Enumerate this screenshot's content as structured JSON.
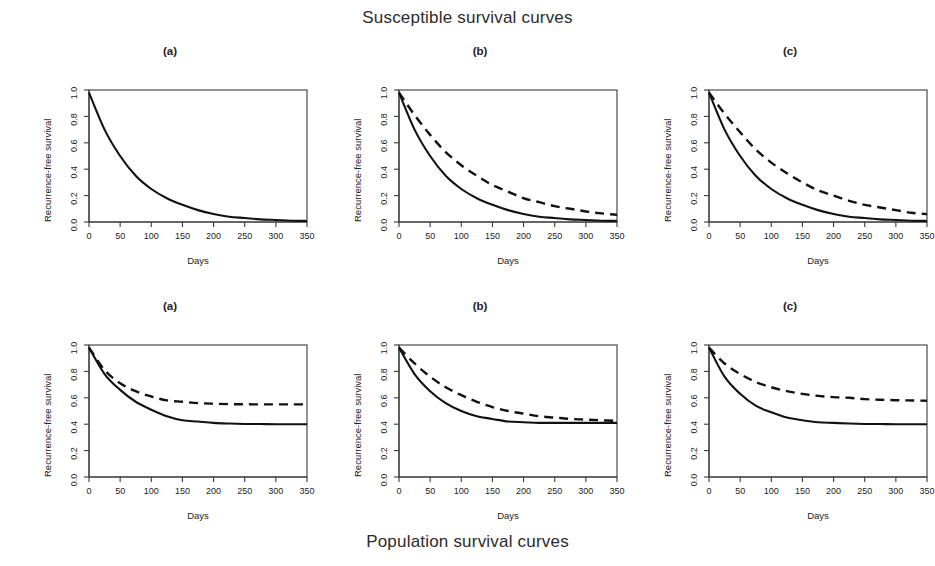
{
  "figure": {
    "top_title": "Susceptible survival curves",
    "bottom_title": "Population survival curves"
  },
  "axes": {
    "xlabel": "Days",
    "ylabel": "Recurrence-free survival",
    "xticks": [
      "0",
      "50",
      "100",
      "150",
      "200",
      "250",
      "300",
      "350"
    ],
    "yticks": [
      "0.0",
      "0.2",
      "0.4",
      "0.6",
      "0.8",
      "1.0"
    ]
  },
  "panel_labels": {
    "a": "(a)",
    "b": "(b)",
    "c": "(c)"
  },
  "colors": {
    "curve": "#111111",
    "frame": "#3a3a3a",
    "background": "#ffffff"
  },
  "chart_data": [
    {
      "type": "line",
      "title": "(a)",
      "group": "Susceptible survival curves",
      "xlabel": "Days",
      "ylabel": "Recurrence-free survival",
      "xlim": [
        0,
        350
      ],
      "ylim": [
        0.0,
        1.0
      ],
      "grid": false,
      "legend": "none",
      "x": [
        0,
        25,
        50,
        75,
        100,
        125,
        150,
        175,
        200,
        225,
        250,
        275,
        300,
        325,
        350
      ],
      "series": [
        {
          "name": "group-1",
          "style": "solid",
          "values": [
            0.98,
            0.7,
            0.5,
            0.35,
            0.25,
            0.18,
            0.13,
            0.09,
            0.06,
            0.04,
            0.03,
            0.02,
            0.015,
            0.01,
            0.008
          ]
        }
      ]
    },
    {
      "type": "line",
      "title": "(b)",
      "group": "Susceptible survival curves",
      "xlabel": "Days",
      "ylabel": "Recurrence-free survival",
      "xlim": [
        0,
        350
      ],
      "ylim": [
        0.0,
        1.0
      ],
      "grid": false,
      "legend": "none",
      "x": [
        0,
        25,
        50,
        75,
        100,
        125,
        150,
        175,
        200,
        225,
        250,
        275,
        300,
        325,
        350
      ],
      "series": [
        {
          "name": "group-1",
          "style": "solid",
          "values": [
            0.98,
            0.7,
            0.5,
            0.35,
            0.25,
            0.18,
            0.13,
            0.09,
            0.06,
            0.04,
            0.03,
            0.02,
            0.015,
            0.01,
            0.008
          ]
        },
        {
          "name": "group-2",
          "style": "dashed",
          "values": [
            0.98,
            0.81,
            0.66,
            0.53,
            0.43,
            0.35,
            0.28,
            0.23,
            0.18,
            0.15,
            0.12,
            0.1,
            0.08,
            0.065,
            0.055
          ]
        }
      ]
    },
    {
      "type": "line",
      "title": "(c)",
      "group": "Susceptible survival curves",
      "xlabel": "Days",
      "ylabel": "Recurrence-free survival",
      "xlim": [
        0,
        350
      ],
      "ylim": [
        0.0,
        1.0
      ],
      "grid": false,
      "legend": "none",
      "x": [
        0,
        25,
        50,
        75,
        100,
        125,
        150,
        175,
        200,
        225,
        250,
        275,
        300,
        325,
        350
      ],
      "series": [
        {
          "name": "group-1",
          "style": "solid",
          "values": [
            0.98,
            0.7,
            0.5,
            0.35,
            0.25,
            0.18,
            0.13,
            0.09,
            0.06,
            0.04,
            0.03,
            0.02,
            0.015,
            0.01,
            0.008
          ]
        },
        {
          "name": "group-2",
          "style": "dashed",
          "values": [
            0.98,
            0.82,
            0.68,
            0.55,
            0.45,
            0.37,
            0.3,
            0.24,
            0.2,
            0.16,
            0.13,
            0.11,
            0.09,
            0.07,
            0.06
          ]
        }
      ]
    },
    {
      "type": "line",
      "title": "(a)",
      "group": "Population survival curves",
      "xlabel": "Days",
      "ylabel": "Recurrence-free survival",
      "xlim": [
        0,
        350
      ],
      "ylim": [
        0.0,
        1.0
      ],
      "grid": false,
      "legend": "none",
      "x": [
        0,
        25,
        50,
        75,
        100,
        125,
        150,
        175,
        200,
        225,
        250,
        275,
        300,
        325,
        350
      ],
      "series": [
        {
          "name": "group-1",
          "style": "solid",
          "values": [
            0.98,
            0.78,
            0.66,
            0.57,
            0.51,
            0.46,
            0.43,
            0.42,
            0.41,
            0.405,
            0.402,
            0.401,
            0.4,
            0.4,
            0.4
          ]
        },
        {
          "name": "group-2",
          "style": "dashed",
          "values": [
            0.98,
            0.81,
            0.71,
            0.65,
            0.61,
            0.58,
            0.57,
            0.56,
            0.555,
            0.552,
            0.551,
            0.55,
            0.55,
            0.55,
            0.55
          ]
        }
      ]
    },
    {
      "type": "line",
      "title": "(b)",
      "group": "Population survival curves",
      "xlabel": "Days",
      "ylabel": "Recurrence-free survival",
      "xlim": [
        0,
        350
      ],
      "ylim": [
        0.0,
        1.0
      ],
      "grid": false,
      "legend": "none",
      "x": [
        0,
        25,
        50,
        75,
        100,
        125,
        150,
        175,
        200,
        225,
        250,
        275,
        300,
        325,
        350
      ],
      "series": [
        {
          "name": "group-1",
          "style": "solid",
          "values": [
            0.98,
            0.78,
            0.65,
            0.56,
            0.5,
            0.46,
            0.44,
            0.42,
            0.415,
            0.41,
            0.41,
            0.41,
            0.41,
            0.41,
            0.41
          ]
        },
        {
          "name": "group-2",
          "style": "dashed",
          "values": [
            0.98,
            0.86,
            0.76,
            0.68,
            0.62,
            0.57,
            0.53,
            0.5,
            0.48,
            0.46,
            0.45,
            0.44,
            0.435,
            0.43,
            0.425
          ]
        }
      ]
    },
    {
      "type": "line",
      "title": "(c)",
      "group": "Population survival curves",
      "xlabel": "Days",
      "ylabel": "Recurrence-free survival",
      "xlim": [
        0,
        350
      ],
      "ylim": [
        0.0,
        1.0
      ],
      "grid": false,
      "legend": "none",
      "x": [
        0,
        25,
        50,
        75,
        100,
        125,
        150,
        175,
        200,
        225,
        250,
        275,
        300,
        325,
        350
      ],
      "series": [
        {
          "name": "group-1",
          "style": "solid",
          "values": [
            0.98,
            0.76,
            0.63,
            0.54,
            0.49,
            0.45,
            0.43,
            0.415,
            0.41,
            0.405,
            0.402,
            0.401,
            0.4,
            0.4,
            0.4
          ]
        },
        {
          "name": "group-2",
          "style": "dashed",
          "values": [
            0.98,
            0.86,
            0.78,
            0.72,
            0.68,
            0.65,
            0.63,
            0.615,
            0.605,
            0.6,
            0.59,
            0.585,
            0.582,
            0.58,
            0.578
          ]
        }
      ]
    }
  ]
}
